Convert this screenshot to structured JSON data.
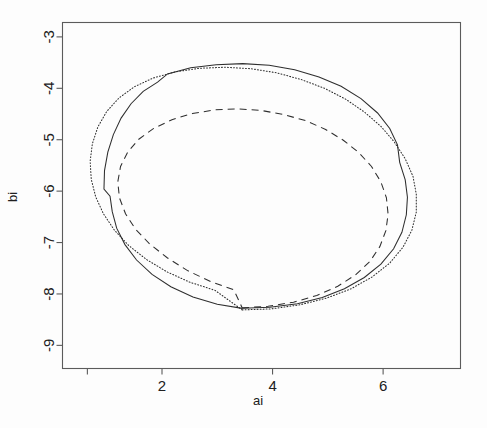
{
  "chart_data": {
    "type": "line",
    "title": "",
    "xlabel": "ai",
    "ylabel": "bi",
    "xlim": [
      0.2,
      7.4
    ],
    "ylim": [
      -9.45,
      -2.72
    ],
    "grid": false,
    "legend": null,
    "xticks": [
      2,
      4,
      6
    ],
    "xtick_labels": [
      "2",
      "4",
      "6"
    ],
    "yticks": [
      -9,
      -8,
      -7,
      -6,
      -5,
      -4,
      -3
    ],
    "ytick_labels": [
      "-9",
      "-8",
      "-7",
      "-6",
      "-5",
      "-4",
      "-3"
    ],
    "untick_labeled_x": [
      0.65
    ],
    "series": [
      {
        "name": "solid-contour",
        "style": "solid",
        "color": "#2e2e2e",
        "closed": true,
        "points": [
          [
            3.45,
            -8.28
          ],
          [
            3.95,
            -8.26
          ],
          [
            4.45,
            -8.19
          ],
          [
            4.9,
            -8.07
          ],
          [
            5.3,
            -7.9
          ],
          [
            5.66,
            -7.68
          ],
          [
            5.96,
            -7.42
          ],
          [
            6.19,
            -7.12
          ],
          [
            6.34,
            -6.8
          ],
          [
            6.42,
            -6.46
          ],
          [
            6.44,
            -6.12
          ],
          [
            6.4,
            -5.78
          ],
          [
            6.3,
            -5.44
          ],
          [
            6.26,
            -5.1
          ],
          [
            6.12,
            -4.78
          ],
          [
            5.9,
            -4.48
          ],
          [
            5.6,
            -4.2
          ],
          [
            5.24,
            -3.96
          ],
          [
            4.84,
            -3.78
          ],
          [
            4.4,
            -3.64
          ],
          [
            3.94,
            -3.55
          ],
          [
            3.46,
            -3.52
          ],
          [
            2.98,
            -3.54
          ],
          [
            2.52,
            -3.6
          ],
          [
            2.1,
            -3.72
          ],
          [
            1.92,
            -3.88
          ],
          [
            1.66,
            -4.06
          ],
          [
            1.44,
            -4.3
          ],
          [
            1.26,
            -4.58
          ],
          [
            1.12,
            -4.9
          ],
          [
            1.02,
            -5.24
          ],
          [
            0.96,
            -5.6
          ],
          [
            0.95,
            -5.96
          ],
          [
            1.06,
            -6.1
          ],
          [
            1.1,
            -6.4
          ],
          [
            1.18,
            -6.72
          ],
          [
            1.33,
            -7.04
          ],
          [
            1.54,
            -7.34
          ],
          [
            1.82,
            -7.62
          ],
          [
            2.16,
            -7.86
          ],
          [
            2.56,
            -8.06
          ],
          [
            3.0,
            -8.2
          ],
          [
            3.45,
            -8.28
          ]
        ]
      },
      {
        "name": "dotted-contour",
        "style": "dotted",
        "color": "#2e2e2e",
        "closed": true,
        "points": [
          [
            3.45,
            -8.31
          ],
          [
            3.98,
            -8.29
          ],
          [
            4.5,
            -8.21
          ],
          [
            4.98,
            -8.08
          ],
          [
            5.42,
            -7.9
          ],
          [
            5.8,
            -7.67
          ],
          [
            6.12,
            -7.4
          ],
          [
            6.36,
            -7.09
          ],
          [
            6.52,
            -6.76
          ],
          [
            6.6,
            -6.41
          ],
          [
            6.6,
            -6.06
          ],
          [
            6.54,
            -5.71
          ],
          [
            6.4,
            -5.37
          ],
          [
            6.2,
            -5.04
          ],
          [
            5.96,
            -4.74
          ],
          [
            5.66,
            -4.46
          ],
          [
            5.32,
            -4.21
          ],
          [
            4.94,
            -4.0
          ],
          [
            4.52,
            -3.83
          ],
          [
            4.08,
            -3.7
          ],
          [
            3.62,
            -3.62
          ],
          [
            3.14,
            -3.59
          ],
          [
            2.68,
            -3.61
          ],
          [
            2.24,
            -3.68
          ],
          [
            1.84,
            -3.8
          ],
          [
            1.5,
            -3.97
          ],
          [
            1.22,
            -4.19
          ],
          [
            1.0,
            -4.45
          ],
          [
            0.84,
            -4.75
          ],
          [
            0.74,
            -5.08
          ],
          [
            0.7,
            -5.42
          ],
          [
            0.72,
            -5.77
          ],
          [
            0.8,
            -6.11
          ],
          [
            0.94,
            -6.44
          ],
          [
            1.14,
            -6.76
          ],
          [
            1.4,
            -7.06
          ],
          [
            1.72,
            -7.33
          ],
          [
            2.09,
            -7.57
          ],
          [
            2.5,
            -7.77
          ],
          [
            2.96,
            -7.93
          ],
          [
            3.45,
            -8.31
          ]
        ]
      },
      {
        "name": "dashed-contour",
        "style": "dashed",
        "color": "#2e2e2e",
        "closed": true,
        "points": [
          [
            3.45,
            -8.27
          ],
          [
            3.92,
            -8.24
          ],
          [
            4.38,
            -8.16
          ],
          [
            4.8,
            -8.03
          ],
          [
            5.18,
            -7.85
          ],
          [
            5.5,
            -7.63
          ],
          [
            5.76,
            -7.37
          ],
          [
            5.94,
            -7.08
          ],
          [
            6.05,
            -6.77
          ],
          [
            6.09,
            -6.45
          ],
          [
            6.06,
            -6.13
          ],
          [
            5.96,
            -5.82
          ],
          [
            5.79,
            -5.52
          ],
          [
            5.56,
            -5.25
          ],
          [
            5.28,
            -5.01
          ],
          [
            4.96,
            -4.8
          ],
          [
            4.6,
            -4.63
          ],
          [
            4.2,
            -4.51
          ],
          [
            3.79,
            -4.43
          ],
          [
            3.37,
            -4.4
          ],
          [
            2.95,
            -4.42
          ],
          [
            2.55,
            -4.49
          ],
          [
            2.18,
            -4.61
          ],
          [
            1.85,
            -4.78
          ],
          [
            1.58,
            -4.99
          ],
          [
            1.38,
            -5.24
          ],
          [
            1.25,
            -5.52
          ],
          [
            1.2,
            -5.82
          ],
          [
            1.23,
            -6.13
          ],
          [
            1.34,
            -6.44
          ],
          [
            1.52,
            -6.74
          ],
          [
            1.78,
            -7.03
          ],
          [
            2.1,
            -7.3
          ],
          [
            2.47,
            -7.55
          ],
          [
            2.88,
            -7.76
          ],
          [
            3.3,
            -7.92
          ],
          [
            3.45,
            -8.27
          ]
        ]
      }
    ]
  },
  "axes": {
    "x_title": "ai",
    "y_title": "bi"
  }
}
